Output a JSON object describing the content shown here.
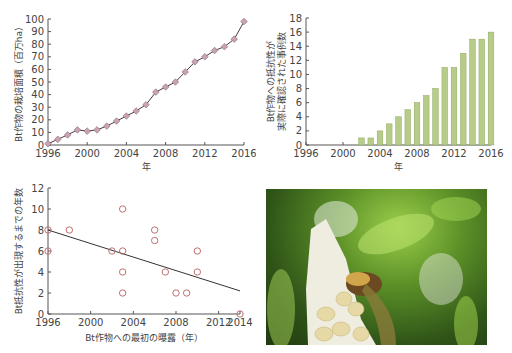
{
  "chart_data": [
    {
      "type": "line",
      "title": "",
      "xlabel": "年",
      "ylabel": "Bt作物の栽培面積（百万ha）",
      "x": [
        1996,
        1997,
        1998,
        1999,
        2000,
        2001,
        2002,
        2003,
        2004,
        2005,
        2006,
        2007,
        2008,
        2009,
        2010,
        2011,
        2012,
        2013,
        2014,
        2015,
        2016
      ],
      "values": [
        1,
        4.5,
        8,
        12,
        11,
        12,
        15,
        19,
        23,
        27,
        32,
        42,
        46,
        50,
        58,
        66,
        70,
        75,
        78,
        84,
        98
      ],
      "xticks": [
        "1996",
        "2000",
        "2004",
        "2008",
        "2012",
        "2016"
      ],
      "yticks": [
        "0",
        "10",
        "20",
        "30",
        "40",
        "50",
        "60",
        "70",
        "80",
        "90",
        "100"
      ],
      "ylim": [
        0,
        100
      ],
      "xlim": [
        1996,
        2016
      ],
      "marker": "diamond",
      "marker_color": "#c9a3b4",
      "line_color": "#4a3a40",
      "grid": false
    },
    {
      "type": "bar",
      "title": "",
      "xlabel": "年",
      "ylabel": "Bt作物への抵抗性が実際に確認された事例数",
      "ylabel_lines": [
        "Bt作物への抵抗性が",
        "実際に確認された事例数"
      ],
      "categories": [
        "2002",
        "2003",
        "2004",
        "2005",
        "2006",
        "2007",
        "2008",
        "2009",
        "2010",
        "2011",
        "2012",
        "2013",
        "2014",
        "2015",
        "2016"
      ],
      "values": [
        1,
        1,
        2,
        3,
        4,
        5,
        6,
        7,
        8,
        11,
        11,
        13,
        15,
        15,
        16
      ],
      "xticks": [
        "1996",
        "2000",
        "2004",
        "2008",
        "2012",
        "2016"
      ],
      "yticks": [
        "0",
        "2",
        "4",
        "6",
        "8",
        "10",
        "12",
        "14",
        "16",
        "18"
      ],
      "ylim": [
        0,
        18
      ],
      "xlim": [
        1996,
        2016
      ],
      "bar_color": "#b8cc8a",
      "bar_edge": "#8aa85a",
      "grid": false
    },
    {
      "type": "scatter",
      "title": "",
      "xlabel": "Bt作物への最初の曝露（年）",
      "ylabel": "Bt抵抗性が出現するまでの年数",
      "points": [
        {
          "x": 1996,
          "y": 8
        },
        {
          "x": 1996,
          "y": 6
        },
        {
          "x": 1998,
          "y": 8
        },
        {
          "x": 2002,
          "y": 6
        },
        {
          "x": 2003,
          "y": 10
        },
        {
          "x": 2003,
          "y": 6
        },
        {
          "x": 2003,
          "y": 4
        },
        {
          "x": 2003,
          "y": 2
        },
        {
          "x": 2006,
          "y": 8
        },
        {
          "x": 2006,
          "y": 7
        },
        {
          "x": 2007,
          "y": 4
        },
        {
          "x": 2008,
          "y": 2
        },
        {
          "x": 2009,
          "y": 2
        },
        {
          "x": 2010,
          "y": 6
        },
        {
          "x": 2010,
          "y": 4
        },
        {
          "x": 2014,
          "y": 0
        }
      ],
      "trendline": {
        "x": [
          1996,
          2014
        ],
        "y": [
          8,
          2.2
        ]
      },
      "xticks": [
        "1996",
        "2000",
        "2004",
        "2008",
        "2012",
        "2014"
      ],
      "yticks": [
        "0",
        "2",
        "4",
        "6",
        "8",
        "10",
        "12"
      ],
      "ylim": [
        0,
        12
      ],
      "xlim": [
        1996,
        2014
      ],
      "marker": "open-circle",
      "marker_color": "#c07070",
      "line_color": "#333333",
      "grid": false
    }
  ],
  "photo": {
    "description": "Close-up of a damaged white corn ear with a caterpillar feeding on kernels against a green blurred background"
  }
}
